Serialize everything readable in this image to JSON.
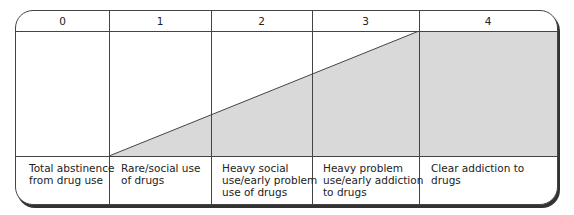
{
  "diagram": {
    "stages": [
      {
        "number": "0",
        "label": "Total abstinence from drug use",
        "lines": [
          "Total abstinence",
          "from drug use"
        ]
      },
      {
        "number": "1",
        "label": "Rare/social use of drugs",
        "lines": [
          "Rare/social use",
          "of drugs"
        ]
      },
      {
        "number": "2",
        "label": "Heavy social use/early problem use of drugs",
        "lines": [
          "Heavy social",
          "use/early problem",
          "use of drugs"
        ]
      },
      {
        "number": "3",
        "label": "Heavy problem use/early addiction to drugs",
        "lines": [
          "Heavy problem",
          "use/early addiction",
          "to drugs"
        ]
      },
      {
        "number": "4",
        "label": "Clear addiction to drugs",
        "lines": [
          "Clear addiction to drugs"
        ]
      }
    ],
    "fill_color": "#d9d9d9",
    "line_color": "#444444"
  }
}
